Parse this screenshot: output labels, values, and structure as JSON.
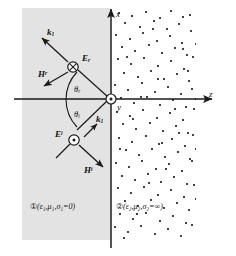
{
  "figure": {
    "background_color": "#ffffff",
    "ink_color": "#1a1a1a"
  },
  "axes": {
    "vertical": {
      "label": "x",
      "direction": "up"
    },
    "horizontal": {
      "label": "z",
      "direction": "right"
    },
    "origin_normal": {
      "label": "y",
      "symbol": "dot-in-circle",
      "meaning": "out-of-page"
    }
  },
  "media": {
    "region1": {
      "marker": "①",
      "text": "(ε₁,μ₁,σ₁=0)",
      "fill": "#e3e3e3",
      "description": "lossless dielectric"
    },
    "region2": {
      "marker": "②",
      "text": "(ε₂,μ₂,σ₂=∞)",
      "fill": "#ffffff",
      "description": "perfect conductor, stippled"
    }
  },
  "vectors": {
    "k_reflected": {
      "label": "k",
      "subscript": "1",
      "description": "reflected wave vector"
    },
    "k_incident": {
      "label": "k",
      "subscript": "1",
      "description": "incident wave vector"
    },
    "E_reflected": {
      "label": "E",
      "subscript": "r",
      "symbol": "cross-in-circle",
      "meaning": "into-page"
    },
    "E_incident": {
      "label": "E",
      "superscript": "i",
      "symbol": "dot-in-circle",
      "meaning": "out-of-page"
    },
    "H_reflected": {
      "label": "H",
      "superscript": "r",
      "description": "reflected magnetic field"
    },
    "H_incident": {
      "label": "H",
      "superscript": "i",
      "description": "incident magnetic field"
    }
  },
  "angles": {
    "theta_r": {
      "symbol": "θ",
      "subscript": "r",
      "description": "angle of reflection"
    },
    "theta_i": {
      "symbol": "θ",
      "subscript": "i",
      "description": "angle of incidence"
    }
  },
  "stipple_points": [
    [
      6,
      4
    ],
    [
      19,
      7
    ],
    [
      33,
      3
    ],
    [
      47,
      9
    ],
    [
      58,
      2
    ],
    [
      70,
      8
    ],
    [
      12,
      14
    ],
    [
      27,
      18
    ],
    [
      41,
      12
    ],
    [
      54,
      20
    ],
    [
      66,
      15
    ],
    [
      77,
      6
    ],
    [
      3,
      26
    ],
    [
      17,
      30
    ],
    [
      30,
      24
    ],
    [
      44,
      32
    ],
    [
      57,
      27
    ],
    [
      69,
      34
    ],
    [
      78,
      22
    ],
    [
      9,
      38
    ],
    [
      22,
      42
    ],
    [
      36,
      36
    ],
    [
      49,
      44
    ],
    [
      62,
      39
    ],
    [
      74,
      46
    ],
    [
      5,
      50
    ],
    [
      18,
      55
    ],
    [
      31,
      49
    ],
    [
      45,
      57
    ],
    [
      58,
      52
    ],
    [
      71,
      60
    ],
    [
      80,
      48
    ],
    [
      11,
      64
    ],
    [
      25,
      68
    ],
    [
      38,
      62
    ],
    [
      51,
      70
    ],
    [
      64,
      65
    ],
    [
      76,
      72
    ],
    [
      2,
      76
    ],
    [
      15,
      81
    ],
    [
      29,
      74
    ],
    [
      42,
      83
    ],
    [
      55,
      78
    ],
    [
      68,
      85
    ],
    [
      79,
      80
    ],
    [
      8,
      89
    ],
    [
      21,
      94
    ],
    [
      34,
      88
    ],
    [
      47,
      96
    ],
    [
      60,
      91
    ],
    [
      73,
      98
    ],
    [
      4,
      103
    ],
    [
      17,
      107
    ],
    [
      30,
      101
    ],
    [
      44,
      109
    ],
    [
      57,
      104
    ],
    [
      70,
      111
    ],
    [
      81,
      100
    ],
    [
      10,
      115
    ],
    [
      23,
      120
    ],
    [
      37,
      114
    ],
    [
      50,
      122
    ],
    [
      63,
      117
    ],
    [
      75,
      124
    ],
    [
      6,
      129
    ],
    [
      19,
      133
    ],
    [
      33,
      127
    ],
    [
      46,
      135
    ],
    [
      59,
      130
    ],
    [
      72,
      137
    ],
    [
      80,
      126
    ],
    [
      13,
      141
    ],
    [
      26,
      146
    ],
    [
      39,
      140
    ],
    [
      52,
      148
    ],
    [
      65,
      143
    ],
    [
      77,
      150
    ],
    [
      3,
      154
    ],
    [
      16,
      158
    ],
    [
      29,
      152
    ],
    [
      43,
      160
    ],
    [
      56,
      155
    ],
    [
      69,
      162
    ],
    [
      79,
      152
    ],
    [
      9,
      167
    ],
    [
      22,
      171
    ],
    [
      35,
      165
    ],
    [
      48,
      173
    ],
    [
      61,
      168
    ],
    [
      74,
      175
    ],
    [
      5,
      179
    ],
    [
      18,
      184
    ],
    [
      31,
      178
    ],
    [
      45,
      186
    ],
    [
      58,
      181
    ],
    [
      71,
      188
    ],
    [
      81,
      176
    ],
    [
      12,
      192
    ],
    [
      25,
      197
    ],
    [
      38,
      191
    ],
    [
      51,
      199
    ],
    [
      64,
      194
    ],
    [
      76,
      201
    ],
    [
      7,
      205
    ],
    [
      20,
      210
    ],
    [
      33,
      204
    ],
    [
      47,
      212
    ],
    [
      60,
      207
    ],
    [
      73,
      214
    ],
    [
      2,
      218
    ],
    [
      15,
      223
    ],
    [
      28,
      217
    ],
    [
      42,
      225
    ],
    [
      55,
      220
    ],
    [
      68,
      227
    ],
    [
      79,
      216
    ],
    [
      11,
      229
    ],
    [
      24,
      205
    ],
    [
      36,
      174
    ],
    [
      49,
      134
    ],
    [
      62,
      100
    ],
    [
      75,
      62
    ],
    [
      14,
      48
    ],
    [
      40,
      20
    ],
    [
      66,
      124
    ],
    [
      28,
      88
    ],
    [
      53,
      160
    ],
    [
      7,
      140
    ],
    [
      70,
      40
    ],
    [
      45,
      70
    ],
    [
      20,
      110
    ],
    [
      83,
      140
    ],
    [
      83,
      90
    ],
    [
      83,
      190
    ],
    [
      83,
      35
    ]
  ]
}
